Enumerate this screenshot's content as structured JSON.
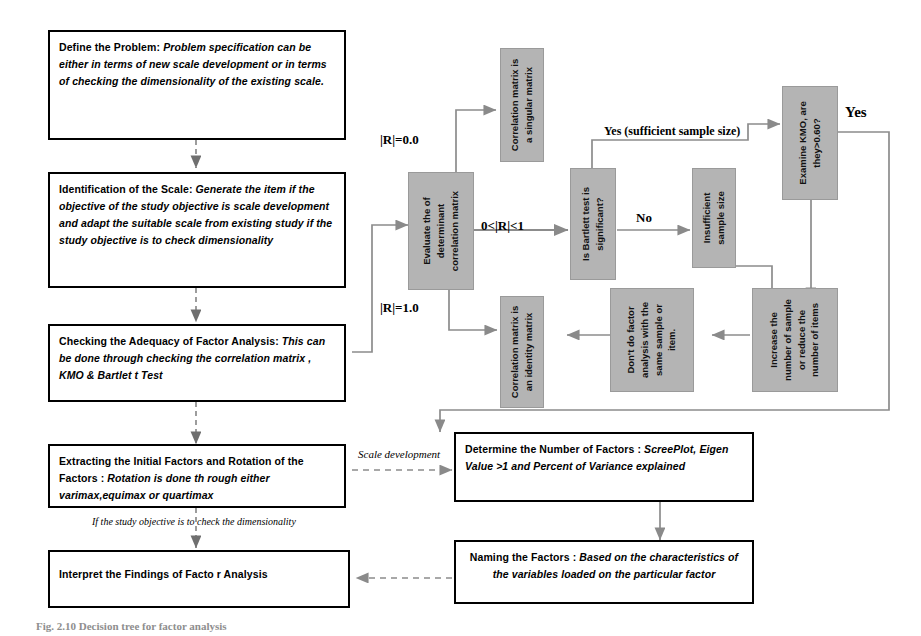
{
  "diagram": {
    "caption": "Fig. 2.10 Decision tree for factor analysis",
    "colors": {
      "gray_box": "#b4b4b4",
      "gray_border": "#9a9a9a",
      "box_border": "#000000",
      "connector": "#808080",
      "background": "#ffffff"
    }
  },
  "white_boxes": [
    {
      "id": "define-the-problem",
      "lead": "Define the Problem:",
      "body": "Problem specification can be either in terms   of new  scale development or in terms of checking the dimensionality of the existing scale."
    },
    {
      "id": "identification-of-the-scale",
      "lead": "Identification of the Scale:",
      "body": "Generate the item if the objective of the study  objective is  scale development   and  adapt   the   suitable   scale from existing study   if the study objective is to check  dimensionality"
    },
    {
      "id": "checking-the-adequacy",
      "lead": "Checking the Adequacy of Factor Analysis:",
      "body": "This can be done through checking the correlation matrix , KMO & Bartlet t   Test"
    },
    {
      "id": "extracting-initial-factors",
      "lead": "Extracting the Initial Factors and Rotation of the Factors  :",
      "body": "Rotation is done th   rough either varimax,equimax or quartimax"
    },
    {
      "id": "interpret-the-findings",
      "lead": "Interpret the Findings of    Facto",
      "body": "r Analysis"
    },
    {
      "id": "determine-number-of-factors",
      "lead": "Determine the Number of Factors :",
      "body": "ScreePlot, Eigen  Value  >1  and  Percent  of  Variance explained"
    },
    {
      "id": "naming-the-factors",
      "lead": "Naming the Factors   :",
      "body": "Based on the characteristics of the variables loaded on the particular factor"
    }
  ],
  "gray_boxes": [
    {
      "id": "evaluate-determinant",
      "lines": [
        "Evaluate       the        of",
        "determinant",
        "correlation matrix"
      ]
    },
    {
      "id": "singular-matrix",
      "lines": [
        "Correlation matrix is",
        "a singular matrix"
      ]
    },
    {
      "id": "identity-matrix",
      "lines": [
        "Correlation matrix is",
        "an identity matrix"
      ]
    },
    {
      "id": "bartlett-test",
      "lines": [
        "Is Bartlett test is",
        "significant?"
      ]
    },
    {
      "id": "insufficient-sample-size",
      "lines": [
        "Insufficient",
        "sample size"
      ]
    },
    {
      "id": "examine-kmo",
      "lines": [
        "Examine KMO, are",
        "they>0.60?"
      ]
    },
    {
      "id": "dont-do-factor-analysis",
      "lines": [
        "Don't do factor",
        "analysis with the",
        "same sample or",
        "item."
      ]
    },
    {
      "id": "increase-sample",
      "lines": [
        "Increase the",
        "number of sample",
        "or reduce the",
        "number of items"
      ]
    }
  ],
  "edge_labels": {
    "r_equals_zero": "|R|=0.0",
    "r_between": "0<|R|<1",
    "r_equals_one": "|R|=1.0",
    "yes_sufficient": "Yes (sufficient sample size)",
    "no": "No",
    "yes_kmo": "Yes",
    "scale_development": "Scale development",
    "check_dimensionality": "If the study objective is to check the dimensionality"
  }
}
